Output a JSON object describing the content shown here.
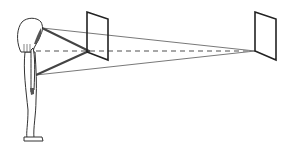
{
  "diagram": {
    "title": "",
    "colors": {
      "background": "#ffffff",
      "stroke": "#333333",
      "dashed_line": "#808080",
      "thin_line": "#555555",
      "hair_shadow": "#555555"
    },
    "elements": {
      "person": {
        "label": ""
      },
      "near_panel": {
        "label": ""
      },
      "far_panel": {
        "label": ""
      },
      "line_of_sight": {
        "label": "",
        "style": "dashed"
      },
      "near_sight_lines": {
        "label": "",
        "style": "thick"
      },
      "far_sight_lines": {
        "label": "",
        "style": "thin"
      }
    }
  }
}
